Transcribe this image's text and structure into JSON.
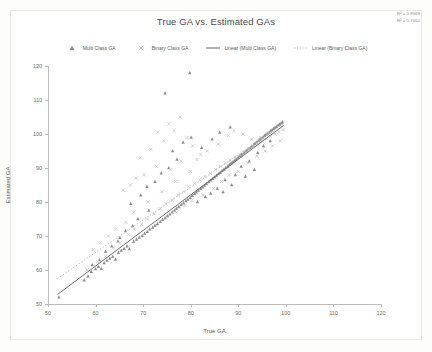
{
  "chart_data": {
    "type": "scatter",
    "title": "True GA vs. Estimated GAs",
    "xlabel": "True GA",
    "ylabel": "Estimated GA",
    "xlim": [
      50,
      120
    ],
    "ylim": [
      50,
      120
    ],
    "xticks": [
      50,
      60,
      70,
      80,
      90,
      100,
      110,
      120
    ],
    "yticks": [
      50,
      60,
      70,
      80,
      90,
      100,
      110,
      120
    ],
    "grid": false,
    "legend_position": "top",
    "annotations": [
      "R² = 0.8569",
      "R² = 0.7054"
    ],
    "series": [
      {
        "name": "Multi Class GA",
        "marker": "triangle",
        "color": "#8c8c8c",
        "points": [
          [
            52.3,
            52.0
          ],
          [
            57.6,
            57.0
          ],
          [
            58.4,
            58.2
          ],
          [
            59.1,
            59.5
          ],
          [
            60.0,
            60.3
          ],
          [
            60.6,
            61.0
          ],
          [
            61.2,
            60.4
          ],
          [
            61.8,
            62.1
          ],
          [
            62.4,
            62.8
          ],
          [
            63.0,
            63.4
          ],
          [
            63.6,
            64.0
          ],
          [
            64.2,
            63.1
          ],
          [
            64.8,
            65.2
          ],
          [
            65.4,
            65.8
          ],
          [
            66.0,
            66.3
          ],
          [
            66.6,
            67.0
          ],
          [
            67.1,
            66.2
          ],
          [
            67.4,
            79.5
          ],
          [
            68.0,
            68.4
          ],
          [
            68.6,
            69.0
          ],
          [
            69.2,
            69.6
          ],
          [
            69.8,
            70.1
          ],
          [
            70.3,
            70.8
          ],
          [
            70.9,
            71.3
          ],
          [
            71.4,
            72.0
          ],
          [
            72.0,
            72.5
          ],
          [
            72.5,
            73.1
          ],
          [
            73.0,
            73.6
          ],
          [
            73.6,
            74.2
          ],
          [
            74.1,
            74.8
          ],
          [
            74.6,
            75.3
          ],
          [
            75.1,
            75.9
          ],
          [
            75.6,
            76.4
          ],
          [
            76.1,
            77.0
          ],
          [
            76.6,
            77.5
          ],
          [
            77.0,
            78.1
          ],
          [
            77.5,
            78.6
          ],
          [
            78.0,
            79.2
          ],
          [
            78.5,
            79.7
          ],
          [
            79.0,
            80.3
          ],
          [
            79.4,
            80.8
          ],
          [
            79.9,
            81.3
          ],
          [
            80.3,
            81.9
          ],
          [
            80.8,
            82.4
          ],
          [
            81.2,
            82.9
          ],
          [
            81.6,
            83.4
          ],
          [
            82.1,
            83.9
          ],
          [
            82.5,
            84.4
          ],
          [
            82.9,
            84.9
          ],
          [
            83.3,
            85.4
          ],
          [
            83.8,
            85.9
          ],
          [
            84.2,
            86.4
          ],
          [
            84.6,
            86.9
          ],
          [
            85.0,
            87.3
          ],
          [
            85.4,
            87.8
          ],
          [
            85.8,
            88.3
          ],
          [
            86.2,
            88.7
          ],
          [
            86.6,
            89.2
          ],
          [
            87.0,
            89.6
          ],
          [
            87.4,
            90.1
          ],
          [
            87.8,
            90.5
          ],
          [
            88.1,
            91.0
          ],
          [
            88.5,
            91.4
          ],
          [
            88.9,
            91.9
          ],
          [
            89.3,
            92.3
          ],
          [
            89.6,
            92.7
          ],
          [
            90.0,
            93.1
          ],
          [
            90.4,
            93.6
          ],
          [
            90.7,
            94.0
          ],
          [
            91.1,
            94.4
          ],
          [
            91.4,
            94.8
          ],
          [
            91.8,
            95.2
          ],
          [
            92.1,
            95.6
          ],
          [
            92.5,
            96.0
          ],
          [
            92.8,
            96.4
          ],
          [
            93.2,
            96.8
          ],
          [
            93.5,
            97.2
          ],
          [
            93.8,
            97.6
          ],
          [
            94.2,
            98.0
          ],
          [
            94.5,
            98.4
          ],
          [
            94.8,
            98.7
          ],
          [
            95.2,
            99.1
          ],
          [
            95.5,
            99.5
          ],
          [
            95.8,
            99.8
          ],
          [
            96.1,
            100.2
          ],
          [
            96.5,
            100.5
          ],
          [
            96.8,
            100.9
          ],
          [
            97.1,
            101.2
          ],
          [
            97.4,
            101.6
          ],
          [
            97.7,
            101.9
          ],
          [
            98.0,
            102.2
          ],
          [
            98.4,
            102.6
          ],
          [
            98.7,
            102.9
          ],
          [
            99.0,
            103.2
          ],
          [
            99.3,
            103.5
          ],
          [
            79.8,
            118.0
          ],
          [
            74.6,
            112.0
          ],
          [
            76.2,
            95.0
          ],
          [
            78.4,
            97.5
          ],
          [
            80.1,
            99.0
          ],
          [
            82.3,
            96.0
          ],
          [
            84.5,
            98.5
          ],
          [
            86.1,
            100.5
          ],
          [
            88.3,
            102.0
          ],
          [
            72.5,
            86.0
          ],
          [
            70.8,
            84.5
          ],
          [
            69.5,
            82.0
          ],
          [
            73.8,
            88.5
          ],
          [
            75.4,
            90.0
          ],
          [
            77.1,
            92.5
          ],
          [
            85.6,
            84.0
          ],
          [
            87.2,
            86.5
          ],
          [
            89.4,
            88.0
          ],
          [
            83.1,
            81.5
          ],
          [
            81.4,
            80.0
          ],
          [
            90.6,
            90.5
          ],
          [
            92.3,
            92.0
          ],
          [
            94.1,
            94.5
          ],
          [
            91.5,
            87.5
          ],
          [
            93.4,
            89.5
          ],
          [
            86.8,
            83.0
          ],
          [
            88.6,
            85.0
          ],
          [
            84.2,
            82.5
          ],
          [
            95.3,
            96.5
          ],
          [
            96.7,
            98.0
          ],
          [
            66.3,
            71.5
          ],
          [
            67.8,
            73.0
          ],
          [
            65.1,
            69.5
          ],
          [
            68.9,
            75.0
          ],
          [
            71.2,
            77.5
          ],
          [
            63.4,
            67.0
          ],
          [
            62.1,
            65.5
          ],
          [
            64.7,
            68.5
          ],
          [
            60.8,
            63.0
          ],
          [
            59.3,
            61.5
          ]
        ]
      },
      {
        "name": "Binary Class GA",
        "marker": "x",
        "color": "#c2c2c2",
        "points": [
          [
            58.2,
            60.0
          ],
          [
            60.4,
            62.5
          ],
          [
            62.1,
            64.0
          ],
          [
            63.8,
            66.5
          ],
          [
            65.2,
            68.0
          ],
          [
            66.9,
            70.5
          ],
          [
            68.1,
            72.0
          ],
          [
            69.7,
            73.5
          ],
          [
            70.9,
            75.0
          ],
          [
            72.3,
            76.5
          ],
          [
            73.6,
            78.0
          ],
          [
            74.8,
            79.5
          ],
          [
            76.1,
            80.5
          ],
          [
            77.3,
            82.0
          ],
          [
            78.5,
            83.0
          ],
          [
            79.6,
            84.5
          ],
          [
            80.8,
            85.5
          ],
          [
            81.9,
            86.5
          ],
          [
            83.0,
            87.5
          ],
          [
            84.1,
            88.5
          ],
          [
            85.2,
            89.5
          ],
          [
            86.2,
            90.5
          ],
          [
            87.3,
            91.5
          ],
          [
            88.3,
            92.3
          ],
          [
            89.3,
            93.2
          ],
          [
            90.3,
            94.0
          ],
          [
            91.3,
            94.8
          ],
          [
            92.2,
            95.6
          ],
          [
            93.2,
            96.4
          ],
          [
            94.1,
            97.1
          ],
          [
            95.0,
            97.9
          ],
          [
            95.9,
            98.6
          ],
          [
            96.8,
            99.3
          ],
          [
            97.7,
            100.0
          ],
          [
            98.5,
            100.6
          ],
          [
            99.4,
            101.3
          ],
          [
            75.4,
            103.0
          ],
          [
            77.8,
            105.0
          ],
          [
            73.1,
            100.5
          ],
          [
            79.2,
            99.0
          ],
          [
            71.6,
            95.5
          ],
          [
            69.4,
            93.0
          ],
          [
            74.3,
            98.0
          ],
          [
            76.5,
            101.0
          ],
          [
            80.4,
            96.5
          ],
          [
            82.1,
            94.0
          ],
          [
            78.0,
            92.0
          ],
          [
            75.8,
            89.5
          ],
          [
            70.2,
            88.0
          ],
          [
            72.8,
            90.5
          ],
          [
            67.3,
            85.0
          ],
          [
            68.5,
            87.0
          ],
          [
            65.8,
            83.5
          ],
          [
            81.3,
            92.5
          ],
          [
            83.5,
            95.0
          ],
          [
            85.8,
            97.0
          ],
          [
            87.9,
            99.5
          ],
          [
            89.1,
            101.0
          ],
          [
            91.0,
            100.0
          ],
          [
            92.8,
            98.5
          ],
          [
            84.8,
            84.0
          ],
          [
            86.5,
            86.0
          ],
          [
            88.1,
            88.0
          ],
          [
            90.0,
            89.0
          ],
          [
            82.6,
            82.0
          ],
          [
            80.2,
            80.5
          ],
          [
            78.8,
            79.0
          ],
          [
            77.0,
            77.0
          ],
          [
            94.6,
            99.0
          ],
          [
            96.2,
            100.5
          ],
          [
            64.2,
            72.0
          ],
          [
            62.7,
            70.0
          ],
          [
            61.0,
            68.0
          ],
          [
            59.5,
            66.0
          ],
          [
            66.4,
            74.0
          ],
          [
            93.9,
            93.5
          ],
          [
            95.6,
            95.0
          ],
          [
            97.2,
            96.5
          ],
          [
            98.8,
            98.0
          ],
          [
            92.0,
            91.5
          ],
          [
            71.0,
            80.0
          ],
          [
            73.9,
            83.0
          ],
          [
            76.8,
            86.0
          ],
          [
            79.9,
            89.0
          ],
          [
            68.0,
            77.0
          ]
        ]
      }
    ],
    "trendlines": [
      {
        "name": "Linear (Multi Class GA)",
        "style": "solid",
        "color": "#6e6e6e",
        "x0": 52.0,
        "y0": 52.8,
        "x1": 99.5,
        "y1": 102.5
      },
      {
        "name": "Linear (Binary Class GA)",
        "style": "dotted",
        "color": "#bdbdbd",
        "x0": 52.0,
        "y0": 57.5,
        "x1": 99.5,
        "y1": 103.0
      }
    ]
  },
  "legend": {
    "items": [
      {
        "label": "Multi Class GA",
        "marker": "triangle"
      },
      {
        "label": "Binary Class GA",
        "marker": "x"
      },
      {
        "label": "Linear (Multi Class GA)",
        "marker": "solid-line"
      },
      {
        "label": "Linear (Binary Class GA)",
        "marker": "dotted-line"
      }
    ]
  }
}
